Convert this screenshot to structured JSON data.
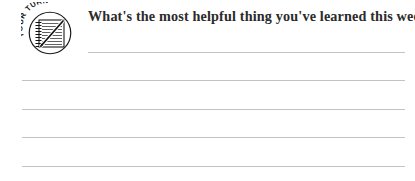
{
  "page": {
    "background_color": "#ffffff",
    "width": 415,
    "height": 181
  },
  "badge": {
    "icon_name": "your-turn-notepad-icon",
    "curved_text": "YOUR TURN",
    "curved_text_chars": [
      "Y",
      "O",
      "U",
      "R",
      " ",
      "T",
      "U",
      "R",
      "N"
    ],
    "inner_graphic": "spiral-bound-notepad-with-pen",
    "ink_color": "#1a1a1a",
    "fill_color": "#ffffff"
  },
  "prompt": {
    "text": "What's the most helpful thing you've learned this week?",
    "color": "#2b2b2b"
  },
  "answer_area": {
    "line_color": "#bdbdbd",
    "line_count": 5,
    "lines": [
      {
        "label": "answer-line-1",
        "value": ""
      },
      {
        "label": "answer-line-2",
        "value": ""
      },
      {
        "label": "answer-line-3",
        "value": ""
      },
      {
        "label": "answer-line-4",
        "value": ""
      },
      {
        "label": "answer-line-5",
        "value": ""
      }
    ]
  }
}
